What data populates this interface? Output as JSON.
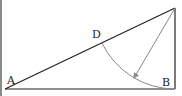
{
  "diagram": {
    "type": "geometry-right-triangle-with-arc",
    "points": {
      "A": {
        "label": "A",
        "x": 5,
        "y": 89
      },
      "B": {
        "label": "B",
        "x": 175,
        "y": 89
      },
      "C": {
        "label": "",
        "x": 175,
        "y": 8
      },
      "D": {
        "label": "D",
        "x": 102,
        "y": 43
      }
    },
    "label_positions": {
      "A": {
        "x": 7,
        "y": 84
      },
      "B": {
        "x": 162,
        "y": 86
      },
      "D": {
        "x": 92,
        "y": 38
      }
    },
    "arc": {
      "center": "C",
      "from": "D",
      "to": "B",
      "radius": 81
    },
    "arrow": {
      "from": "C",
      "to_x": 134,
      "to_y": 78
    },
    "colors": {
      "stroke": "#222222",
      "arc": "#888888",
      "arrow": "#888888",
      "left_edge": "#8a8a8a"
    }
  }
}
